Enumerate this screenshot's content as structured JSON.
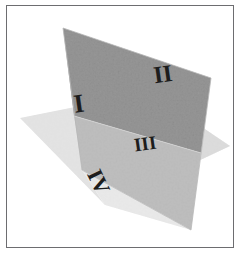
{
  "figure": {
    "border_color": "#6d6d70",
    "background_color": "#ffffff"
  },
  "colors": {
    "vertical_plane_upper": "#c2c2c2",
    "vertical_plane_lower": "#dcdcdc",
    "horizontal_plane": "#f1f1f1",
    "horizontal_plane_far": "#e8e8e8",
    "numeral_color": "#1d1d1d",
    "edge_color": "#b4b4b4"
  },
  "planes": [
    {
      "name": "vertical-plane",
      "label": "Vertical plane",
      "points": "63,28 211,78 191,230 82,170",
      "fill": "#c2c2c2"
    },
    {
      "name": "vertical-plane-lower-band",
      "label": "Vertical plane below horizon",
      "points": "74,116 201,153 191,230 82,170",
      "fill": "#dcdcdc"
    },
    {
      "name": "horizontal-plane",
      "label": "Horizontal plane",
      "points": "20,118 150,92 230,146 105,205",
      "fill": "#f1f1f1"
    }
  ],
  "numerals": [
    {
      "name": "quadrant-label-i",
      "text": "I",
      "x": 80,
      "y": 112,
      "size": 26,
      "rotation": -8,
      "quadrant": "I",
      "region": "upper-left of vertical plane"
    },
    {
      "name": "quadrant-label-ii",
      "text": "II",
      "x": 164,
      "y": 82,
      "size": 24,
      "rotation": -8,
      "quadrant": "II",
      "region": "upper-right of vertical plane"
    },
    {
      "name": "quadrant-label-iii",
      "text": "III",
      "x": 146,
      "y": 150,
      "size": 19,
      "rotation": -8,
      "quadrant": "III",
      "region": "lower-right below horizon line"
    },
    {
      "name": "quadrant-label-iv",
      "text": "IV",
      "x": 92,
      "y": 185,
      "size": 22,
      "rotation": 64,
      "quadrant": "IV",
      "region": "front of horizontal plane"
    }
  ]
}
